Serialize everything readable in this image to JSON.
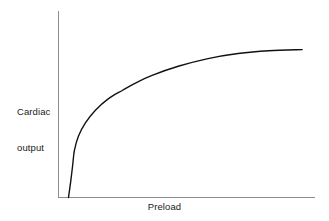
{
  "chart_data": {
    "type": "line",
    "title": "",
    "subtitle": "",
    "xlabel": "Preload",
    "ylabel": "Cardiac output",
    "ylabel_line1": "Cardiac",
    "ylabel_line2": "output",
    "xtick_labels": [],
    "ytick_labels": [],
    "grid": false,
    "legend": null,
    "annotations": [],
    "axis_color": "#8c8c8c",
    "curve_color": "#111111",
    "background_color": "#ffffff",
    "xlim": [
      0,
      1
    ],
    "ylim": [
      0,
      1
    ],
    "series": [
      {
        "name": "Cardiac output vs preload",
        "points": [
          {
            "x": 0.039,
            "y": 0.0
          },
          {
            "x": 0.047,
            "y": 0.08
          },
          {
            "x": 0.055,
            "y": 0.17
          },
          {
            "x": 0.062,
            "y": 0.253
          },
          {
            "x": 0.078,
            "y": 0.33
          },
          {
            "x": 0.105,
            "y": 0.4
          },
          {
            "x": 0.144,
            "y": 0.468
          },
          {
            "x": 0.195,
            "y": 0.53
          },
          {
            "x": 0.25,
            "y": 0.575
          },
          {
            "x": 0.292,
            "y": 0.608
          },
          {
            "x": 0.365,
            "y": 0.655
          },
          {
            "x": 0.47,
            "y": 0.705
          },
          {
            "x": 0.583,
            "y": 0.745
          },
          {
            "x": 0.7,
            "y": 0.772
          },
          {
            "x": 0.82,
            "y": 0.787
          },
          {
            "x": 0.95,
            "y": 0.793
          }
        ]
      }
    ]
  },
  "figure": {
    "y_axis_name": "y-axis-line",
    "x_axis_name": "x-axis-line",
    "curve_name": "cardiac-output-curve"
  }
}
